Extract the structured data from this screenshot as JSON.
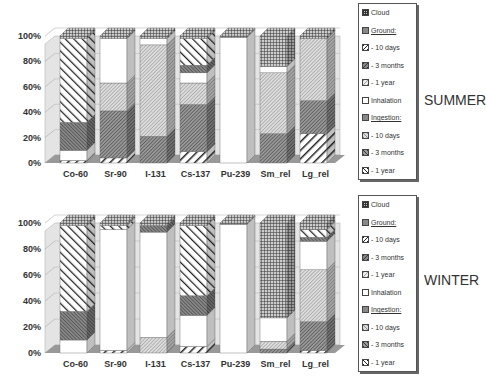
{
  "chart_data": [
    {
      "type": "bar",
      "stacked": "percent",
      "style": "3d-column",
      "title": "SUMMER",
      "categories": [
        "Co-60",
        "Sr-90",
        "I-131",
        "Cs-137",
        "Pu-239",
        "Sm_rel",
        "Lg_rel"
      ],
      "yticks": [
        "0%",
        "20%",
        "40%",
        "60%",
        "80%",
        "100%"
      ],
      "ylim": [
        0,
        100
      ],
      "grid": true,
      "legend_position": "right",
      "series": [
        {
          "name": "Ingestion - 1 year",
          "values": [
            2,
            4,
            0,
            9,
            0,
            0,
            23
          ]
        },
        {
          "name": "Ingestion - 3 months",
          "values": [
            0,
            37,
            21,
            37,
            0,
            23,
            26
          ]
        },
        {
          "name": "Ingestion - 10 days",
          "values": [
            0,
            22,
            72,
            17,
            0,
            48,
            49
          ]
        },
        {
          "name": "Inhalation",
          "values": [
            8,
            35,
            5,
            8,
            99,
            5,
            0
          ]
        },
        {
          "name": "Ground - 1 year",
          "values": [
            0,
            0,
            0,
            0,
            0,
            0,
            0
          ]
        },
        {
          "name": "Ground - 3 months",
          "values": [
            22,
            0,
            0,
            6,
            0,
            0,
            0
          ]
        },
        {
          "name": "Ground - 10 days",
          "values": [
            66,
            0,
            0,
            21,
            0,
            0,
            0
          ]
        },
        {
          "name": "Cloud",
          "values": [
            2,
            2,
            2,
            2,
            1,
            24,
            2
          ]
        }
      ]
    },
    {
      "type": "bar",
      "stacked": "percent",
      "style": "3d-column",
      "title": "WINTER",
      "categories": [
        "Co-60",
        "Sr-90",
        "I-131",
        "Cs-137",
        "Pu-239",
        "Sm_rel",
        "Lg_rel"
      ],
      "yticks": [
        "0%",
        "20%",
        "40%",
        "60%",
        "80%",
        "100%"
      ],
      "ylim": [
        0,
        100
      ],
      "grid": true,
      "legend_position": "right",
      "series": [
        {
          "name": "Ingestion - 1 year",
          "values": [
            0,
            2,
            0,
            5,
            0,
            0,
            2
          ]
        },
        {
          "name": "Ingestion - 3 months",
          "values": [
            0,
            0,
            0,
            0,
            0,
            3,
            22
          ]
        },
        {
          "name": "Ingestion - 10 days",
          "values": [
            0,
            0,
            12,
            0,
            0,
            6,
            40
          ]
        },
        {
          "name": "Inhalation",
          "values": [
            10,
            93,
            81,
            24,
            99,
            18,
            22
          ]
        },
        {
          "name": "Ground - 1 year",
          "values": [
            0,
            0,
            0,
            0,
            0,
            0,
            0
          ]
        },
        {
          "name": "Ground - 3 months",
          "values": [
            22,
            0,
            5,
            15,
            0,
            0,
            3
          ]
        },
        {
          "name": "Ground - 10 days",
          "values": [
            66,
            3,
            0,
            54,
            0,
            0,
            6
          ]
        },
        {
          "name": "Cloud",
          "values": [
            2,
            2,
            2,
            2,
            1,
            73,
            5
          ]
        }
      ]
    }
  ],
  "legend": [
    {
      "label": "Cloud",
      "header": false
    },
    {
      "label": "Ground:",
      "header": true
    },
    {
      "label": "- 10 days",
      "header": false
    },
    {
      "label": "- 3 months",
      "header": false
    },
    {
      "label": "- 1 year",
      "header": false
    },
    {
      "label": "Inhalation",
      "header": false
    },
    {
      "label": "Ingestion:",
      "header": true
    },
    {
      "label": "- 10 days",
      "header": false
    },
    {
      "label": "- 3 months",
      "header": false
    },
    {
      "label": "- 1 year",
      "header": false
    }
  ],
  "panels": {
    "summer": {
      "label": "SUMMER"
    },
    "winter": {
      "label": "WINTER"
    }
  }
}
